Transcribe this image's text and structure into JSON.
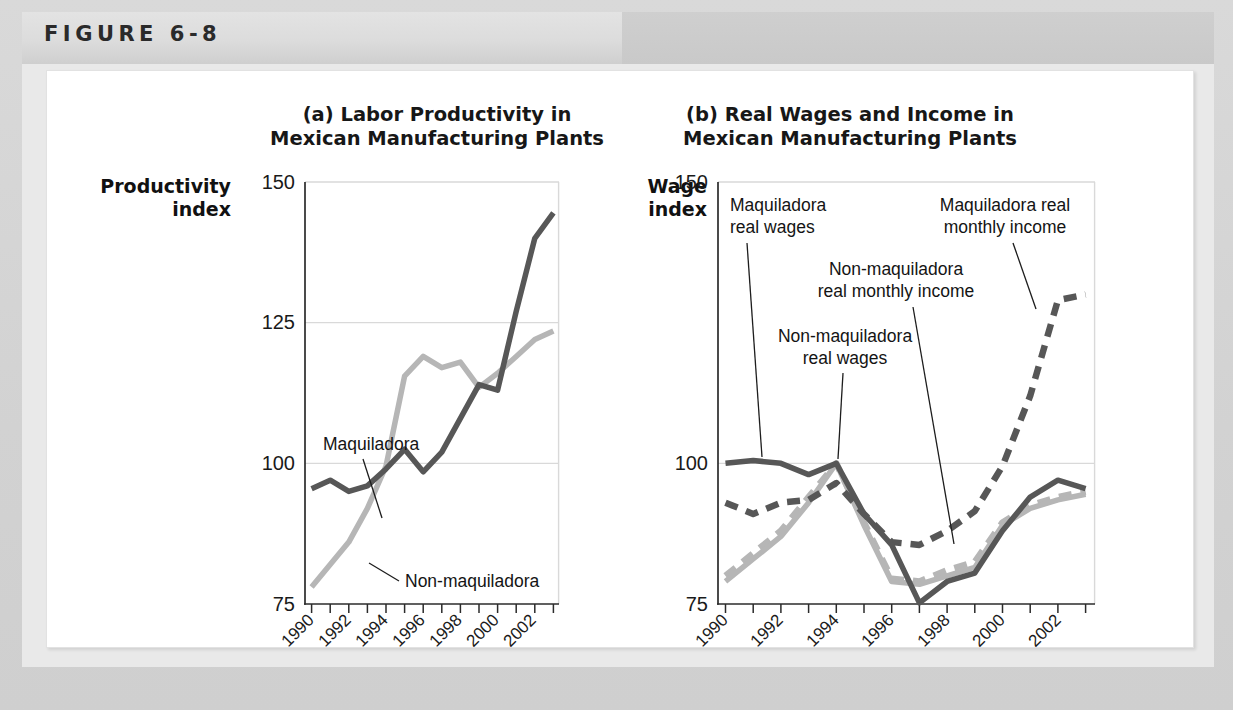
{
  "figure": {
    "label": "FIGURE 6-8"
  },
  "colors": {
    "dark_series": "#575757",
    "light_series": "#b6b6b6",
    "gridline": "#d9d9d9",
    "frame": "#adadad",
    "axis": "#2b2b2b",
    "panel_background": "#ffffff",
    "page_background": "#d4d4d4",
    "header_band": "#dcdcdc"
  },
  "chart_data": [
    {
      "type": "line",
      "panel": "a",
      "title": "(a) Labor Productivity in\nMexican Manufacturing Plants",
      "ylabel": "Productivity\nindex",
      "xlabel": "",
      "ylim": [
        75,
        150
      ],
      "yticks": [
        75,
        100,
        125,
        150
      ],
      "ytick_labels": [
        "75",
        "100",
        "125",
        "150"
      ],
      "gridlines": [
        100,
        125,
        150
      ],
      "grid": true,
      "legend": "inline-annotations",
      "x": [
        1990,
        1991,
        1992,
        1993,
        1994,
        1995,
        1996,
        1997,
        1998,
        1999,
        2000,
        2001,
        2002,
        2003
      ],
      "xtick_labels": [
        "1990",
        "1992",
        "1994",
        "1996",
        "1998",
        "2000",
        "2002"
      ],
      "xtick_years": [
        1990,
        1992,
        1994,
        1996,
        1998,
        2000,
        2002
      ],
      "series": [
        {
          "name": "Maquiladora",
          "style": "solid",
          "color": "#575757",
          "values": [
            95.5,
            97.0,
            95.0,
            96.0,
            99.0,
            102.5,
            98.5,
            102.0,
            108.0,
            114.0,
            113.0,
            127.0,
            140.0,
            144.5
          ]
        },
        {
          "name": "Non-maquiladora",
          "style": "solid",
          "color": "#b6b6b6",
          "values": [
            78.0,
            82.0,
            86.0,
            92.0,
            99.5,
            115.5,
            119.0,
            117.0,
            118.0,
            113.5,
            116.0,
            119.0,
            122.0,
            123.5
          ]
        }
      ],
      "annotations": [
        {
          "text": "Maquiladora",
          "points_to_series": "Maquiladora"
        },
        {
          "text": "Non-maquiladora",
          "points_to_series": "Non-maquiladora"
        }
      ]
    },
    {
      "type": "line",
      "panel": "b",
      "title": "(b) Real Wages and Income in\nMexican Manufacturing Plants",
      "ylabel": "Wage\nindex",
      "xlabel": "",
      "ylim": [
        75,
        150
      ],
      "yticks": [
        75,
        100,
        150
      ],
      "ytick_labels": [
        "75",
        "100",
        "150"
      ],
      "gridlines": [
        100
      ],
      "grid": true,
      "legend": "inline-annotations",
      "x": [
        1990,
        1991,
        1992,
        1993,
        1994,
        1995,
        1996,
        1997,
        1998,
        1999,
        2000,
        2001,
        2002,
        2003
      ],
      "xtick_labels": [
        "1990",
        "1992",
        "1994",
        "1996",
        "1998",
        "2000",
        "2002"
      ],
      "xtick_years": [
        1990,
        1992,
        1994,
        1996,
        1998,
        2000,
        2002
      ],
      "series": [
        {
          "name": "Maquiladora real wages",
          "style": "solid",
          "color": "#575757",
          "values": [
            100.0,
            100.5,
            100.0,
            98.0,
            100.0,
            91.0,
            85.5,
            75.2,
            79.0,
            80.5,
            88.0,
            94.0,
            97.0,
            95.5
          ]
        },
        {
          "name": "Non-maquiladora real wages",
          "style": "solid",
          "color": "#b6b6b6",
          "values": [
            79.0,
            83.0,
            87.0,
            93.0,
            100.0,
            89.0,
            79.0,
            78.5,
            80.0,
            81.5,
            89.0,
            92.0,
            93.5,
            94.5
          ]
        },
        {
          "name": "Non-maquiladora real monthly income",
          "style": "dashed",
          "color": "#b6b6b6",
          "values": [
            80.0,
            84.0,
            88.0,
            94.0,
            100.0,
            89.5,
            79.5,
            79.0,
            81.0,
            82.5,
            89.5,
            92.5,
            94.0,
            95.0
          ]
        },
        {
          "name": "Maquiladora real monthly income",
          "style": "dashed",
          "color": "#575757",
          "values": [
            93.0,
            91.0,
            93.0,
            93.5,
            96.5,
            91.0,
            86.0,
            85.5,
            88.0,
            91.5,
            99.5,
            112.0,
            129.0,
            130.0
          ]
        }
      ],
      "annotations": [
        {
          "text": "Maquiladora\nreal wages",
          "points_to_series": "Maquiladora real wages"
        },
        {
          "text": "Non-maquiladora\nreal wages",
          "points_to_series": "Non-maquiladora real wages"
        },
        {
          "text": "Non-maquiladora\nreal monthly income",
          "points_to_series": "Non-maquiladora real monthly income"
        },
        {
          "text": "Maquiladora real\nmonthly income",
          "points_to_series": "Maquiladora real monthly income"
        }
      ]
    }
  ],
  "labels": {
    "a_title_line1": "(a) Labor Productivity in",
    "a_title_line2": "Mexican Manufacturing Plants",
    "b_title_line1": "(b) Real Wages and Income in",
    "b_title_line2": "Mexican Manufacturing Plants",
    "a_axisname_line1": "Productivity",
    "a_axisname_line2": "index",
    "b_axisname_line1": "Wage",
    "b_axisname_line2": "index",
    "a_y_150": "150",
    "a_y_125": "125",
    "a_y_100": "100",
    "a_y_75": "75",
    "b_y_150": "150",
    "b_y_100": "100",
    "b_y_75": "75",
    "ann_maquiladora": "Maquiladora",
    "ann_non_maquiladora": "Non-maquiladora",
    "ann_maq_real_wages_l1": "Maquiladora",
    "ann_maq_real_wages_l2": "real wages",
    "ann_nonmaq_real_wages_l1": "Non-maquiladora",
    "ann_nonmaq_real_wages_l2": "real wages",
    "ann_nonmaq_income_l1": "Non-maquiladora",
    "ann_nonmaq_income_l2": "real monthly income",
    "ann_maq_income_l1": "Maquiladora real",
    "ann_maq_income_l2": "monthly income",
    "x_1990": "1990",
    "x_1992": "1992",
    "x_1994": "1994",
    "x_1996": "1996",
    "x_1998": "1998",
    "x_2000": "2000",
    "x_2002": "2002"
  }
}
